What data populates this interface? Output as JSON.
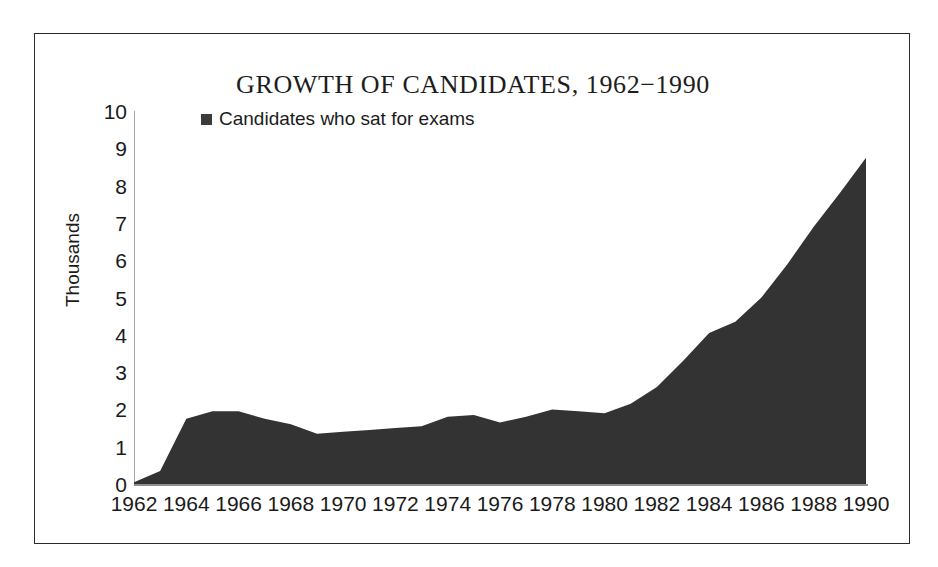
{
  "chart_data": {
    "type": "area",
    "title": "GROWTH OF CANDIDATES, 1962−1990",
    "xlabel": "",
    "ylabel": "Thousands",
    "ylim": [
      0,
      10
    ],
    "xlim": [
      1962,
      1990
    ],
    "grid": false,
    "legend_position": "top-left-inside",
    "series_color": "#333333",
    "axis_color": "#8f8f8f",
    "frame_color": "#2b2b2b",
    "legend": [
      {
        "label": "Candidates who sat for exams",
        "marker": "square",
        "color": "#3b3b3b"
      }
    ],
    "ytick_labels": [
      "10",
      "9",
      "8",
      "7",
      "6",
      "5",
      "4",
      "3",
      "2",
      "1",
      "0"
    ],
    "ytick_values": [
      10,
      9,
      8,
      7,
      6,
      5,
      4,
      3,
      2,
      1,
      0
    ],
    "xtick_labels": [
      "1962",
      "1964",
      "1966",
      "1968",
      "1970",
      "1972",
      "1974",
      "1976",
      "1978",
      "1980",
      "1982",
      "1984",
      "1986",
      "1988",
      "1990"
    ],
    "xtick_values": [
      1962,
      1964,
      1966,
      1968,
      1970,
      1972,
      1974,
      1976,
      1978,
      1980,
      1982,
      1984,
      1986,
      1988,
      1990
    ],
    "x": [
      1962,
      1963,
      1964,
      1965,
      1966,
      1967,
      1968,
      1969,
      1970,
      1971,
      1972,
      1973,
      1974,
      1975,
      1976,
      1977,
      1978,
      1979,
      1980,
      1981,
      1982,
      1983,
      1984,
      1985,
      1986,
      1987,
      1988,
      1989,
      1990
    ],
    "values": [
      0.05,
      0.35,
      1.75,
      1.95,
      1.95,
      1.75,
      1.6,
      1.35,
      1.4,
      1.45,
      1.5,
      1.55,
      1.8,
      1.85,
      1.65,
      1.8,
      2.0,
      1.95,
      1.9,
      2.15,
      2.6,
      3.3,
      4.05,
      4.35,
      5.0,
      5.9,
      6.9,
      7.8,
      8.75
    ],
    "series": [
      {
        "name": "Candidates who sat for exams",
        "values": [
          0.05,
          0.35,
          1.75,
          1.95,
          1.95,
          1.75,
          1.6,
          1.35,
          1.4,
          1.45,
          1.5,
          1.55,
          1.8,
          1.85,
          1.65,
          1.8,
          2.0,
          1.95,
          1.9,
          2.15,
          2.6,
          3.3,
          4.05,
          4.35,
          5.0,
          5.9,
          6.9,
          7.8,
          8.75
        ]
      }
    ]
  }
}
